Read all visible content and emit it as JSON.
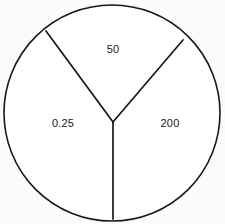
{
  "chart_data": {
    "type": "pie",
    "title": "",
    "subtitle": "",
    "xlabel": "",
    "ylabel": "",
    "legend": "none",
    "grid": false,
    "style": "outline-only, unfilled white sectors, black strokes",
    "center": {
      "x": 113,
      "y": 122
    },
    "circle": {
      "cx": 112,
      "cy": 113,
      "r": 108
    },
    "categories": [
      "50",
      "0.25",
      "200"
    ],
    "values": [
      50,
      0.25,
      200
    ],
    "labels": [
      "50",
      "0.25",
      "200"
    ],
    "slices": [
      {
        "label": "50",
        "value": 50,
        "position": "top",
        "label_x": 113,
        "label_y": 50,
        "start_angle_deg": 306,
        "end_angle_deg": 36,
        "fill": "#ffffff",
        "stroke": "#17161a"
      },
      {
        "label": "0.25",
        "value": 0.25,
        "position": "left",
        "label_x": 63,
        "label_y": 124,
        "start_angle_deg": 180,
        "end_angle_deg": 306,
        "fill": "#ffffff",
        "stroke": "#17161a"
      },
      {
        "label": "200",
        "value": 200,
        "position": "right",
        "label_x": 170,
        "label_y": 124,
        "start_angle_deg": 36,
        "end_angle_deg": 180,
        "fill": "#ffffff",
        "stroke": "#17161a"
      }
    ],
    "dividers": [
      {
        "name": "upper-left-divider",
        "from_x": 113,
        "from_y": 122,
        "to_x": 46,
        "to_y": 31
      },
      {
        "name": "upper-right-divider",
        "from_x": 113,
        "from_y": 122,
        "to_x": 183,
        "to_y": 40
      },
      {
        "name": "bottom-divider",
        "from_x": 113,
        "from_y": 122,
        "to_x": 113,
        "to_y": 219
      }
    ],
    "colors": {
      "background": "#fbfbfb",
      "stroke": "#17161a",
      "slice_fill": "#ffffff",
      "label_text": "#1a191d"
    }
  }
}
